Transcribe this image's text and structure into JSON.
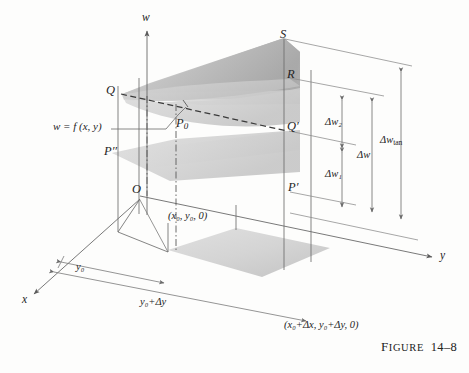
{
  "figure": {
    "caption_word_first_letter": "F",
    "caption_word_rest": "IGURE",
    "caption_number": "14–8",
    "caption_full": "Figure 14–8"
  },
  "axes": {
    "w": "w",
    "y": "y",
    "x": "x"
  },
  "points": {
    "Q": "Q",
    "S": "S",
    "R": "R",
    "Q_prime": "Q′",
    "P_prime": "P′",
    "P_double_prime": "P′′",
    "P0": "P",
    "P0_sub": "0"
  },
  "surface_label": {
    "equation": "w = f (x, y)",
    "lhs": "w",
    "eq": "=",
    "fn": "f",
    "args": "(x, y)"
  },
  "coordinates": {
    "base_point": "(x₀, y₀, 0)",
    "base_point_parts": {
      "x": "x",
      "x_sub": "0",
      "y": "y",
      "y_sub": "0",
      "z": "0"
    },
    "far_point": "(x₀+Δx, y₀+Δy, 0)"
  },
  "dimensions": {
    "y0": "y₀",
    "y0_plus_dy": "y₀+Δy",
    "delta_w1": "Δw₁",
    "delta_w2": "Δw₂",
    "delta_w": "Δw",
    "delta_w_tan": "Δwₜₐₙ",
    "delta_w_tan_base": "Δw",
    "delta_w_tan_sub": "tan"
  },
  "colors": {
    "ink": "#242424",
    "line": "#555555",
    "surface_light": "#d9d9d9",
    "surface_mid": "#c4c4c4",
    "surface_dark": "#a8a8a8",
    "background": "#fdfdfc"
  }
}
